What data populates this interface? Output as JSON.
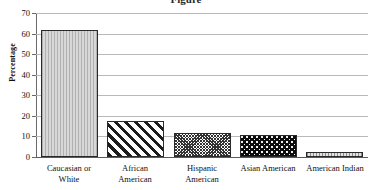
{
  "chart_data": {
    "type": "bar",
    "title": "",
    "title_fragment": "Figure",
    "xlabel": "",
    "ylabel": "Percentage",
    "ylim": [
      0,
      70
    ],
    "ytick_step": 10,
    "yticks": [
      70,
      60,
      50,
      40,
      30,
      20,
      10,
      0
    ],
    "grid": true,
    "legend": "none",
    "categories": [
      "Caucasian or White",
      "African American",
      "Hispanic American",
      "Asian American",
      "American Indian"
    ],
    "values": [
      61.5,
      17.5,
      11.7,
      10.7,
      2.2
    ],
    "bars": [
      {
        "label_line1": "Caucasian or",
        "label_line2": "White",
        "value": 61.5,
        "pattern": "vertical-lines",
        "pattern_name": "light-grey-vertical-lines"
      },
      {
        "label_line1": "African",
        "label_line2": "American",
        "value": 17.5,
        "pattern": "diagonal-stripes",
        "pattern_name": "black-diagonal-stripes"
      },
      {
        "label_line1": "Hispanic",
        "label_line2": "American",
        "value": 11.7,
        "pattern": "checker",
        "pattern_name": "dark-grey-crosshatch"
      },
      {
        "label_line1": "Asian American",
        "label_line2": "",
        "value": 10.7,
        "pattern": "black-dots",
        "pattern_name": "black-with-white-dots"
      },
      {
        "label_line1": "American Indian",
        "label_line2": "",
        "value": 2.2,
        "pattern": "light-dash",
        "pattern_name": "light-grey-dashes"
      }
    ],
    "colors": {
      "gridline": "#b9b9b9",
      "axis": "#6a6a6a",
      "bar_outline": "#2a2a2a",
      "text": "#111111",
      "background": "#ffffff"
    }
  }
}
